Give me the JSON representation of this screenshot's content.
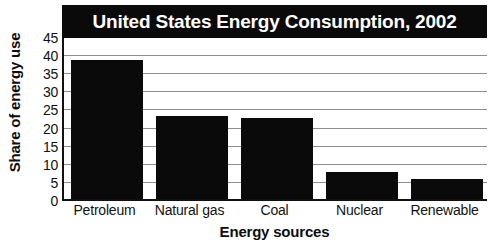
{
  "chart_data": {
    "type": "bar",
    "title": "United States Energy Consumption, 2002",
    "xlabel": "Energy sources",
    "ylabel": "Share of energy use",
    "categories": [
      "Petroleum",
      "Natural gas",
      "Coal",
      "Nuclear",
      "Renewable"
    ],
    "values": [
      39,
      23.5,
      23,
      8,
      6
    ],
    "ylim": [
      0,
      45
    ],
    "ytick_labels": [
      "0",
      "5",
      "10",
      "15",
      "20",
      "25",
      "30",
      "35",
      "40",
      "45"
    ],
    "ytick_values": [
      0,
      5,
      10,
      15,
      20,
      25,
      30,
      35,
      40,
      45
    ],
    "grid": true,
    "legend": "none",
    "bar_color": "#0a0a0a",
    "title_background": "#0a0a0a",
    "title_color": "#ffffff",
    "gridline_color": "#8e8e8e",
    "axis_color": "#111111"
  }
}
